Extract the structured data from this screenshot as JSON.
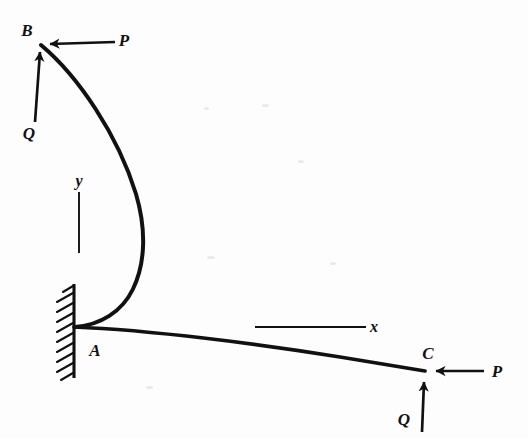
{
  "figure": {
    "kind": "engineering-diagram",
    "background_color": "#fdfdfd",
    "ink_color": "#111111"
  },
  "labels": {
    "point_b": "B",
    "point_a": "A",
    "point_c": "C",
    "force_p_top": "P",
    "force_q_top": "Q",
    "force_p_right": "P",
    "force_q_bottom": "Q",
    "axis_x": "x",
    "axis_y": "y"
  },
  "geometry": {
    "point_b": [
      41,
      44
    ],
    "point_a": [
      74,
      327
    ],
    "point_c": [
      425,
      371
    ],
    "upper_curve_max_x": 143,
    "wall_x": 74,
    "wall_top_y": 285,
    "wall_bottom_y": 378,
    "x_axis": {
      "x1": 255,
      "x2": 365,
      "y": 327
    },
    "y_axis": {
      "x": 79,
      "y1": 192,
      "y2": 253
    }
  },
  "label_positions": {
    "point_b": [
      27,
      30
    ],
    "point_a": [
      95,
      350
    ],
    "point_c": [
      428,
      353
    ],
    "force_p_top": [
      124,
      40
    ],
    "force_q_top": [
      29,
      133
    ],
    "force_p_right": [
      497,
      371
    ],
    "force_q_bottom": [
      404,
      419
    ],
    "axis_x": [
      374,
      327
    ],
    "axis_y": [
      79,
      181
    ]
  },
  "arrows": {
    "p_at_b": {
      "from": [
        115,
        42
      ],
      "to": [
        46,
        44
      ],
      "direction": "left"
    },
    "q_at_b": {
      "from": [
        35,
        122
      ],
      "to": [
        41,
        47
      ],
      "direction": "up"
    },
    "p_at_c": {
      "from": [
        484,
        371
      ],
      "to": [
        431,
        371
      ],
      "direction": "left"
    },
    "q_at_c": {
      "from": [
        422,
        432
      ],
      "to": [
        424,
        377
      ],
      "direction": "up"
    }
  }
}
